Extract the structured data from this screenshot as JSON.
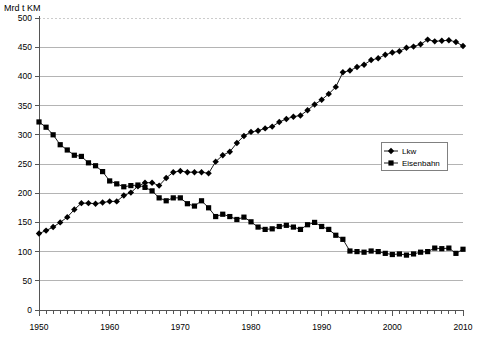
{
  "chart_data": {
    "type": "line",
    "title": "",
    "subtitle": "",
    "unit_label": "Mrd t KM",
    "xlabel": "",
    "ylabel": "",
    "xlim": [
      1950,
      2010
    ],
    "ylim": [
      0,
      500
    ],
    "ytick_step": 50,
    "yticks": [
      0,
      50,
      100,
      150,
      200,
      250,
      300,
      350,
      400,
      450,
      500
    ],
    "xticks_labeled": [
      1950,
      1960,
      1970,
      1980,
      1990,
      2000,
      2010
    ],
    "xtick_minor_step": 1,
    "grid": "horizontal",
    "legend_position": "right-upper-inside",
    "x": [
      1950,
      1951,
      1952,
      1953,
      1954,
      1955,
      1956,
      1957,
      1958,
      1959,
      1960,
      1961,
      1962,
      1963,
      1964,
      1965,
      1966,
      1967,
      1968,
      1969,
      1970,
      1971,
      1972,
      1973,
      1974,
      1975,
      1976,
      1977,
      1978,
      1979,
      1980,
      1981,
      1982,
      1983,
      1984,
      1985,
      1986,
      1987,
      1988,
      1989,
      1990,
      1991,
      1992,
      1993,
      1994,
      1995,
      1996,
      1997,
      1998,
      1999,
      2000,
      2001,
      2002,
      2003,
      2004,
      2005,
      2006,
      2007,
      2008,
      2009,
      2010
    ],
    "series": [
      {
        "name": "Lkw",
        "marker": "diamond",
        "color": "#000000",
        "values": [
          131,
          136,
          142,
          150,
          159,
          172,
          183,
          183,
          182,
          184,
          186,
          186,
          196,
          201,
          212,
          218,
          218,
          213,
          226,
          236,
          238,
          236,
          236,
          236,
          234,
          254,
          265,
          271,
          286,
          298,
          305,
          307,
          311,
          314,
          322,
          327,
          331,
          333,
          342,
          352,
          360,
          370,
          382,
          407,
          410,
          416,
          420,
          428,
          431,
          437,
          441,
          443,
          449,
          451,
          455,
          463,
          460,
          461,
          462,
          459,
          452
        ]
      },
      {
        "name": "Eisenbahn",
        "marker": "square",
        "color": "#000000",
        "values": [
          322,
          313,
          300,
          283,
          274,
          265,
          263,
          252,
          247,
          237,
          221,
          216,
          211,
          213,
          214,
          210,
          204,
          192,
          187,
          192,
          192,
          182,
          178,
          187,
          175,
          160,
          164,
          160,
          155,
          159,
          151,
          142,
          138,
          139,
          143,
          145,
          142,
          138,
          146,
          150,
          143,
          138,
          128,
          121,
          101,
          100,
          99,
          101,
          100,
          97,
          95,
          96,
          94,
          96,
          99,
          100,
          106,
          105,
          106,
          97,
          104
        ]
      }
    ]
  }
}
